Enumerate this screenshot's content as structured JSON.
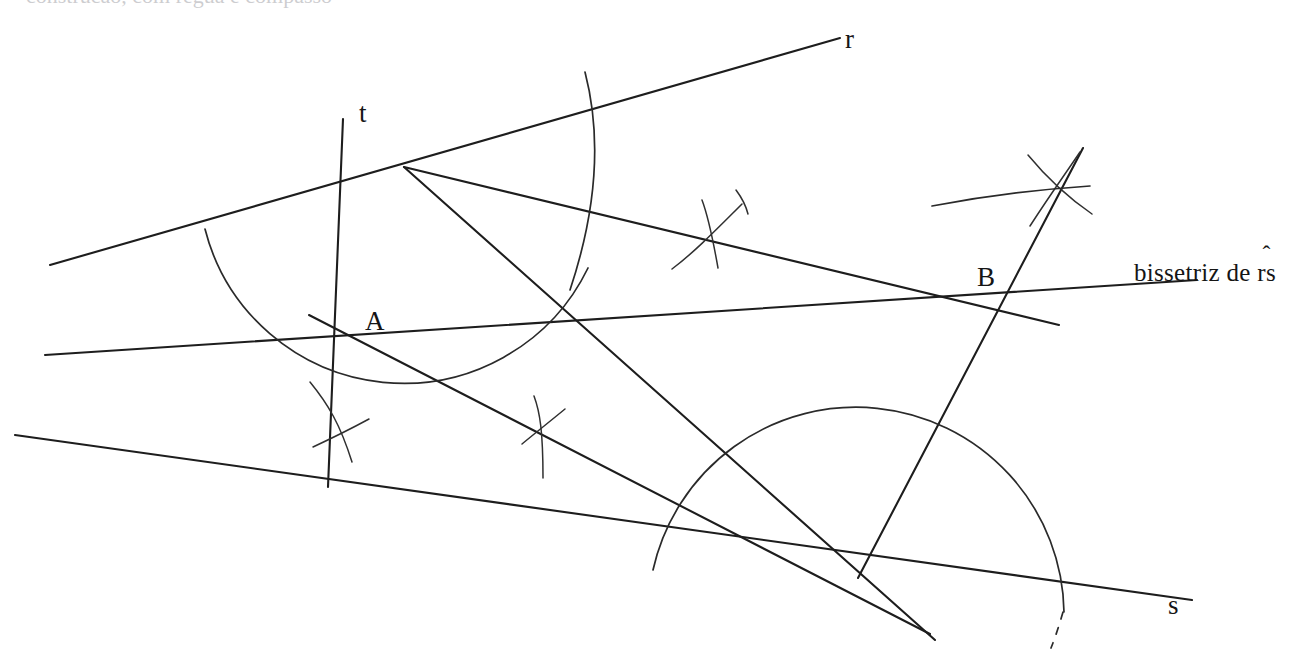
{
  "figure": {
    "type": "geometric-construction",
    "background_color": "#ffffff",
    "ink_color": "#1d1d1d",
    "width": 1304,
    "height": 666,
    "cropped_top_text": "construcao, com regua e compasso"
  },
  "labels": {
    "line_r": "r",
    "line_t": "t",
    "line_s": "s",
    "point_a": "A",
    "point_b": "B",
    "bisector_prefix": "bissetriz de ",
    "bisector_angle_letters": "rs",
    "bisector_angle_hat": "ˆ",
    "bisector_full": "bissetriz de r̂s"
  },
  "geometry": {
    "vertices": [
      {
        "name": "vertex-top",
        "x": 404,
        "y": 167
      },
      {
        "name": "point-A",
        "x": 363,
        "y": 338
      },
      {
        "name": "point-B",
        "x": 997,
        "y": 305
      },
      {
        "name": "vertex-bottom",
        "x": 858,
        "y": 578
      }
    ],
    "lines": [
      {
        "name": "line-r",
        "x1": 50,
        "y1": 265,
        "x2": 840,
        "y2": 38
      },
      {
        "name": "line-s",
        "x1": 15,
        "y1": 435,
        "x2": 1192,
        "y2": 600
      },
      {
        "name": "line-t",
        "x1": 328,
        "y1": 487,
        "x2": 343,
        "y2": 119
      },
      {
        "name": "line-bisector-rs",
        "x1": 45,
        "y1": 355,
        "x2": 1197,
        "y2": 280
      },
      {
        "name": "line-top-vertex-to-bottom-vertex",
        "x1": 404,
        "y1": 167,
        "x2": 935,
        "y2": 640
      },
      {
        "name": "line-A-to-bottom-vertex",
        "x1": 309,
        "y1": 315,
        "x2": 930,
        "y2": 634
      },
      {
        "name": "line-top-vertex-through-B",
        "x1": 404,
        "y1": 167,
        "x2": 1059,
        "y2": 325
      },
      {
        "name": "line-B-perpendicular",
        "x1": 1083,
        "y1": 148,
        "x2": 858,
        "y2": 578
      }
    ],
    "arcs": [
      {
        "name": "arc-top-vertex-big",
        "center_x": 404,
        "center_y": 167,
        "radius": 205
      },
      {
        "name": "arc-bottom-vertex-big",
        "center_x": 858,
        "center_y": 578,
        "radius": 208
      },
      {
        "name": "arc-cross-near-A-lower"
      },
      {
        "name": "arc-cross-mid-left"
      },
      {
        "name": "arc-cross-mid-right"
      },
      {
        "name": "arc-cross-upper-right"
      },
      {
        "name": "arc-shallow-right"
      }
    ],
    "dashed_segment": {
      "name": "arc-bottom-dashed-tail",
      "x1": 1063,
      "y1": 612,
      "x2": 1051,
      "y2": 648
    }
  }
}
